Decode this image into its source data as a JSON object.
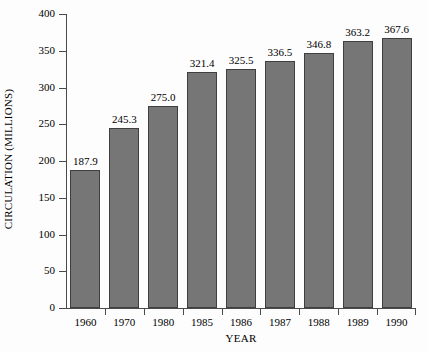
{
  "chart_data": {
    "type": "bar",
    "title": "",
    "subtitle": "",
    "xlabel": "YEAR",
    "ylabel": "CIRCULATION (MILLIONS)",
    "categories": [
      "1960",
      "1970",
      "1980",
      "1985",
      "1986",
      "1987",
      "1988",
      "1989",
      "1990"
    ],
    "values": [
      187.9,
      245.3,
      275.0,
      321.4,
      325.5,
      336.5,
      346.8,
      363.2,
      367.6
    ],
    "value_labels": [
      "187.9",
      "245.3",
      "275.0",
      "321.4",
      "325.5",
      "336.5",
      "346.8",
      "363.2",
      "367.6"
    ],
    "ylim": [
      0,
      400
    ],
    "ytick_values": [
      0,
      50,
      100,
      150,
      200,
      250,
      300,
      350,
      400
    ],
    "ytick_labels": [
      "0",
      "50",
      "100",
      "150",
      "200",
      "250",
      "300",
      "350",
      "400"
    ],
    "grid": false,
    "legend": null,
    "legend_position": "none",
    "series": [
      {
        "name": "Circulation",
        "values": [
          187.9,
          245.3,
          275.0,
          321.4,
          325.5,
          336.5,
          346.8,
          363.2,
          367.6
        ]
      }
    ],
    "colors": {
      "bar_fill": "#767676",
      "bar_stroke": "#3f3f3f",
      "axis": "#4a4a4a",
      "text": "#000000",
      "background": "#fdfdfd"
    }
  }
}
